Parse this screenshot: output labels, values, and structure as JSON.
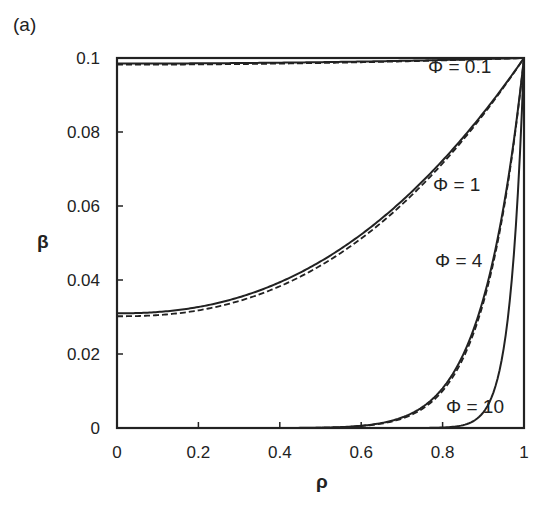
{
  "panel_label": "(a)",
  "chart_data": {
    "type": "line",
    "title": "",
    "xlabel": "ρ",
    "ylabel": "β",
    "xlim": [
      0,
      1
    ],
    "ylim": [
      0,
      0.1
    ],
    "grid": false,
    "x_ticks": [
      "0",
      "0.2",
      "0.4",
      "0.6",
      "0.8",
      "1"
    ],
    "y_ticks": [
      "0",
      "0.02",
      "0.04",
      "0.06",
      "0.08",
      "0.1"
    ],
    "x": [
      0,
      0.1,
      0.2,
      0.3,
      0.4,
      0.5,
      0.6,
      0.7,
      0.8,
      0.85,
      0.9,
      0.95,
      1.0
    ],
    "series": [
      {
        "name": "Φ = 0.1 (solid)",
        "style": "solid",
        "values": [
          0.0985,
          0.0985,
          0.0986,
          0.0987,
          0.0988,
          0.0989,
          0.0991,
          0.0993,
          0.0995,
          0.0996,
          0.0997,
          0.0999,
          0.1
        ]
      },
      {
        "name": "Φ = 0.1 (dashed)",
        "style": "dashed",
        "values": [
          0.0984,
          0.0984,
          0.0985,
          0.0986,
          0.0987,
          0.0988,
          0.099,
          0.0992,
          0.0994,
          0.0996,
          0.0997,
          0.0998,
          0.1
        ]
      },
      {
        "name": "Φ = 1 (solid)",
        "style": "solid",
        "values": [
          0.031,
          0.0314,
          0.0328,
          0.0352,
          0.0386,
          0.0431,
          0.0488,
          0.0556,
          0.0636,
          0.0681,
          0.073,
          0.0782,
          0.1
        ]
      },
      {
        "name": "Φ = 1 (dashed)",
        "style": "dashed",
        "values": [
          0.0302,
          0.0306,
          0.032,
          0.0344,
          0.0378,
          0.0424,
          0.0481,
          0.055,
          0.0631,
          0.0676,
          0.0726,
          0.0779,
          0.1
        ]
      },
      {
        "name": "Φ = 4",
        "style": "solid",
        "values": [
          0,
          0,
          0,
          0,
          0.0001,
          0.001,
          0.006,
          0.017,
          0.0107,
          0.02,
          0.035,
          0.06,
          0.1
        ]
      },
      {
        "name": "Φ = 10",
        "style": "solid",
        "values": [
          0,
          0,
          0,
          0,
          0,
          0,
          0,
          0,
          0.0004,
          0.0034,
          0.0025,
          0.0166,
          0.1
        ]
      }
    ],
    "annotations": [
      {
        "text": "Φ = 0.1",
        "x": 0.93,
        "y": 0.095
      },
      {
        "text": "Φ = 1",
        "x": 0.88,
        "y": 0.072
      },
      {
        "text": "Φ = 4",
        "x": 0.82,
        "y": 0.045
      },
      {
        "text": "Φ = 10",
        "x": 0.91,
        "y": 0.005
      }
    ]
  }
}
